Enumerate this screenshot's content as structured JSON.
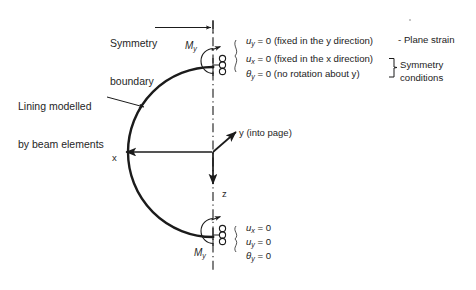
{
  "figure": {
    "title_hidden": "Tunnel lining half-model boundary conditions",
    "labels": {
      "symmetry_boundary_l1": "Symmetry",
      "symmetry_boundary_l2": "boundary",
      "lining_l1": "Lining modelled",
      "lining_l2": "by beam elements",
      "moment_top": "M",
      "moment_top_sub": "y",
      "moment_bottom": "M",
      "moment_bottom_sub": "y"
    },
    "axes": {
      "x_label": "x",
      "y_label": "y (into page)",
      "z_label": "z"
    },
    "top_conditions": [
      {
        "symbol": "u",
        "subscript": "y",
        "value": " = 0 ",
        "note": "(fixed in the y direction)"
      },
      {
        "symbol": "u",
        "subscript": "x",
        "value": " = 0 ",
        "note": "(fixed in the x direction)"
      },
      {
        "symbol": "θ",
        "subscript": "y",
        "value": " = 0 ",
        "note": "(no rotation about y)"
      }
    ],
    "group_labels": {
      "plane_strain_dash": "-",
      "plane_strain": "Plane strain",
      "symmetry_l1": "Symmetry",
      "symmetry_l2": "conditions"
    },
    "bottom_conditions": [
      {
        "symbol": "u",
        "subscript": "x",
        "value": " = 0"
      },
      {
        "symbol": "u",
        "subscript": "y",
        "value": " = 0"
      },
      {
        "symbol": "θ",
        "subscript": "y",
        "value": " = 0"
      }
    ],
    "colors": {
      "line": "#1b1b1b",
      "text": "#262626",
      "background": "#ffffff"
    },
    "geometry": {
      "arc_center_x": 213,
      "arc_center_y": 152,
      "arc_radius": 85,
      "symmetry_axis_x": 213,
      "symmetry_axis_top_y": 20,
      "symmetry_axis_bottom_y": 272
    }
  }
}
